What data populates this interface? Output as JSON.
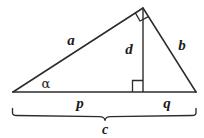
{
  "figure": {
    "name": "right-triangle-with-altitude",
    "background_color": "#ffffff",
    "stroke_color": "#2b2b2b",
    "label_color": "#1a1a1a",
    "labels": {
      "hypotenuse_leg_a": "a",
      "leg_b": "b",
      "altitude_d": "d",
      "segment_p": "p",
      "segment_q": "q",
      "base_c": "c",
      "angle_alpha": "α"
    },
    "geometry": {
      "left_vertex": [
        13,
        92
      ],
      "right_vertex": [
        196,
        92
      ],
      "apex": [
        143,
        8
      ],
      "altitude_foot": [
        143,
        92
      ],
      "brace_left": [
        12,
        115
      ],
      "brace_right": [
        196,
        115
      ],
      "brace_notch": [
        105,
        120
      ]
    },
    "markers": {
      "right_angle_apex": "square-marker-at-apex",
      "right_angle_foot": "square-marker-at-altitude-foot"
    },
    "label_positions": {
      "a": [
        71,
        40
      ],
      "b": [
        182,
        45
      ],
      "d": [
        129,
        49
      ],
      "p": [
        80,
        103
      ],
      "q": [
        167,
        103
      ],
      "c": [
        105,
        130
      ],
      "alpha": [
        46,
        83
      ]
    },
    "label_sizes": {
      "a": 15,
      "b": 15,
      "d": 15,
      "p": 15,
      "q": 15,
      "c": 14,
      "alpha": 13
    }
  }
}
